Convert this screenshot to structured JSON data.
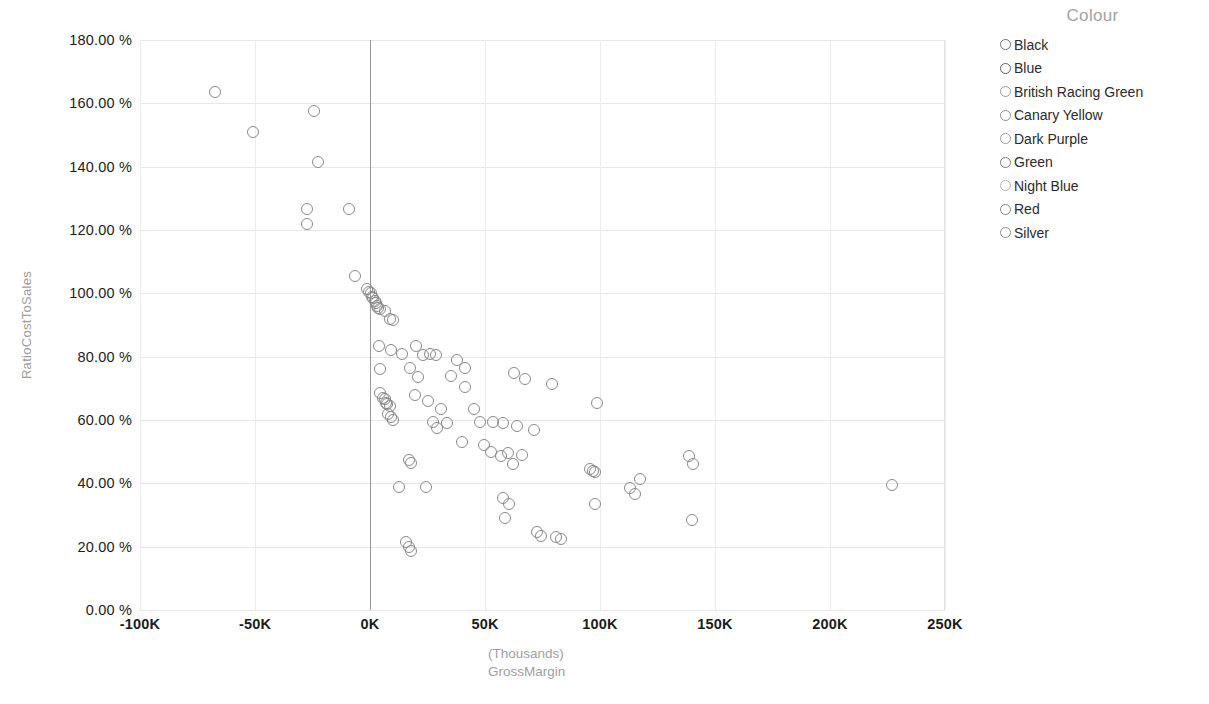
{
  "legend": {
    "title": "Colour",
    "position": "right",
    "items": [
      {
        "label": "Black",
        "swatch": "#707070"
      },
      {
        "label": "Blue",
        "swatch": "#5e5e5e"
      },
      {
        "label": "British Racing Green",
        "swatch": "#9a9a9a"
      },
      {
        "label": "Canary Yellow",
        "swatch": "#8e8e8e"
      },
      {
        "label": "Dark Purple",
        "swatch": "#9c9c9c"
      },
      {
        "label": "Green",
        "swatch": "#7a7a7a"
      },
      {
        "label": "Night Blue",
        "swatch": "#b4b4b4"
      },
      {
        "label": "Red",
        "swatch": "#878787"
      },
      {
        "label": "Silver",
        "swatch": "#8f8f8f"
      }
    ]
  },
  "axis": {
    "y_title": "RatioCostToSales",
    "x_title_line1": "(Thousands)",
    "x_title_line2": "GrossMargin",
    "y_ticks": [
      "0.00 %",
      "20.00 %",
      "40.00 %",
      "60.00 %",
      "80.00 %",
      "100.00 %",
      "120.00 %",
      "140.00 %",
      "160.00 %",
      "180.00 %"
    ],
    "x_ticks": [
      "-100K",
      "-50K",
      "0K",
      "50K",
      "100K",
      "150K",
      "200K",
      "250K"
    ]
  },
  "chart_data": {
    "type": "scatter",
    "title": "",
    "xlabel": "GrossMargin (Thousands)",
    "ylabel": "RatioCostToSales",
    "xlim": [
      -100,
      250
    ],
    "ylim": [
      0,
      180
    ],
    "x_unit": "K",
    "y_unit": "%",
    "grid": true,
    "legend_position": "right",
    "marker": "open-circle",
    "marker_color": "#8a8a8a",
    "reference_line_x": 0,
    "series": [
      {
        "name": "Colour",
        "points": [
          [
            -67.5,
            163.5
          ],
          [
            -51.0,
            151.0
          ],
          [
            -24.5,
            157.5
          ],
          [
            -22.5,
            141.5
          ],
          [
            -27.5,
            126.5
          ],
          [
            -27.5,
            122.0
          ],
          [
            -9.0,
            126.5
          ],
          [
            -6.5,
            105.5
          ],
          [
            -1.5,
            101.5
          ],
          [
            -0.5,
            100.5
          ],
          [
            0.5,
            100.0
          ],
          [
            1.0,
            99.0
          ],
          [
            1.5,
            98.5
          ],
          [
            2.0,
            97.5
          ],
          [
            2.5,
            97.0
          ],
          [
            3.0,
            96.0
          ],
          [
            3.5,
            95.5
          ],
          [
            4.5,
            95.0
          ],
          [
            6.5,
            94.5
          ],
          [
            8.5,
            92.0
          ],
          [
            10.0,
            91.5
          ],
          [
            4.0,
            83.5
          ],
          [
            9.0,
            82.0
          ],
          [
            14.0,
            81.0
          ],
          [
            20.0,
            83.5
          ],
          [
            23.0,
            80.5
          ],
          [
            26.0,
            81.0
          ],
          [
            28.5,
            80.5
          ],
          [
            4.5,
            76.0
          ],
          [
            17.5,
            76.5
          ],
          [
            21.0,
            73.5
          ],
          [
            38.0,
            79.0
          ],
          [
            41.5,
            76.5
          ],
          [
            35.0,
            74.0
          ],
          [
            62.5,
            75.0
          ],
          [
            67.5,
            73.0
          ],
          [
            79.0,
            71.5
          ],
          [
            41.5,
            70.5
          ],
          [
            19.5,
            68.0
          ],
          [
            4.5,
            68.5
          ],
          [
            5.5,
            67.0
          ],
          [
            6.5,
            66.5
          ],
          [
            7.0,
            65.5
          ],
          [
            7.5,
            65.0
          ],
          [
            8.5,
            64.5
          ],
          [
            25.0,
            66.0
          ],
          [
            31.0,
            63.5
          ],
          [
            45.0,
            63.5
          ],
          [
            98.5,
            65.5
          ],
          [
            8.0,
            62.0
          ],
          [
            9.0,
            61.0
          ],
          [
            10.0,
            60.0
          ],
          [
            27.5,
            59.5
          ],
          [
            33.5,
            59.0
          ],
          [
            48.0,
            59.5
          ],
          [
            53.5,
            59.5
          ],
          [
            58.0,
            59.0
          ],
          [
            29.0,
            57.5
          ],
          [
            64.0,
            58.0
          ],
          [
            71.5,
            57.0
          ],
          [
            40.0,
            53.0
          ],
          [
            49.5,
            52.0
          ],
          [
            52.5,
            50.0
          ],
          [
            57.0,
            48.5
          ],
          [
            60.0,
            49.5
          ],
          [
            66.0,
            49.0
          ],
          [
            17.0,
            47.5
          ],
          [
            18.0,
            46.5
          ],
          [
            62.0,
            46.0
          ],
          [
            95.5,
            44.5
          ],
          [
            97.0,
            44.0
          ],
          [
            98.0,
            43.5
          ],
          [
            117.5,
            41.5
          ],
          [
            138.5,
            48.5
          ],
          [
            140.5,
            46.0
          ],
          [
            12.5,
            39.0
          ],
          [
            24.5,
            39.0
          ],
          [
            113.0,
            38.5
          ],
          [
            115.0,
            36.5
          ],
          [
            98.0,
            33.5
          ],
          [
            227.0,
            39.5
          ],
          [
            58.0,
            35.5
          ],
          [
            60.5,
            33.5
          ],
          [
            58.5,
            29.0
          ],
          [
            140.0,
            28.5
          ],
          [
            72.5,
            24.5
          ],
          [
            74.5,
            23.5
          ],
          [
            81.0,
            23.0
          ],
          [
            83.0,
            22.5
          ],
          [
            15.5,
            21.5
          ],
          [
            17.0,
            20.0
          ],
          [
            18.0,
            18.5
          ]
        ]
      }
    ]
  }
}
